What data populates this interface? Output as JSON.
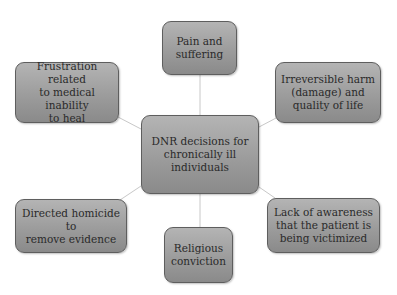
{
  "diagram": {
    "type": "hub-and-spoke",
    "center": {
      "label": "DNR decisions for chronically ill individuals",
      "lines": [
        "DNR decisions for",
        "chronically ill",
        "individuals"
      ]
    },
    "nodes": [
      {
        "id": "top",
        "lines": [
          "Pain and",
          "suffering"
        ]
      },
      {
        "id": "top-left",
        "lines": [
          "Frustration related",
          "to medical inability",
          "to heal"
        ]
      },
      {
        "id": "top-right",
        "lines": [
          "Irreversible harm",
          "(damage) and",
          "quality of life"
        ]
      },
      {
        "id": "bottom-left",
        "lines": [
          "Directed homicide to",
          "remove evidence"
        ]
      },
      {
        "id": "bottom",
        "lines": [
          "Religious",
          "conviction"
        ]
      },
      {
        "id": "bottom-right",
        "lines": [
          "Lack of awareness",
          "that the patient is",
          "being victimized"
        ]
      }
    ],
    "colors": {
      "box_fill_top": "#b4b4b4",
      "box_fill_bottom": "#8a8a8a",
      "border": "#5e5e5e",
      "connector": "#c8c8c8",
      "text": "#2a2a2a"
    }
  }
}
